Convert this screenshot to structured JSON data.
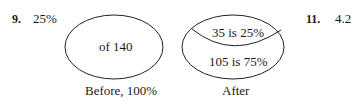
{
  "problem_9": {
    "number": "9.",
    "answer": "25%",
    "before_diagram": {
      "inner_label": "of 140",
      "caption": "Before, 100%"
    },
    "after_diagram": {
      "top_label": "35 is 25%",
      "bottom_label": "105 is 75%",
      "caption": "After"
    }
  },
  "problem_11": {
    "number": "11.",
    "answer": "4.2"
  }
}
